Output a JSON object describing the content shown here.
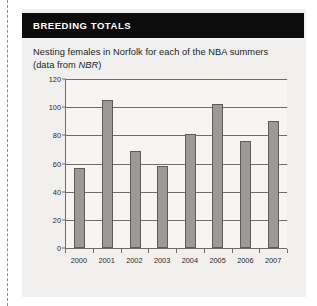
{
  "panel": {
    "header_title": "BREEDING TOTALS",
    "subtitle_line1": "Nesting females in Norfolk for each of the NBA summers",
    "subtitle_line2_pre": "(data from ",
    "subtitle_line2_italic": "NBR",
    "subtitle_line2_post": ")"
  },
  "colors": {
    "header_background": "#0d0d0d",
    "header_text": "#ffffff",
    "panel_background": "#f1f0ef",
    "plot_background": "#f6f5f4",
    "bar_fill": "#9b9a98",
    "bar_border": "#5d5c5a",
    "axis": "#6e6d6b"
  },
  "chart_data": {
    "type": "bar",
    "title": "BREEDING TOTALS",
    "subtitle": "Nesting females in Norfolk for each of the NBA summers (data from NBR)",
    "categories": [
      "2000",
      "2001",
      "2002",
      "2003",
      "2004",
      "2005",
      "2006",
      "2007"
    ],
    "values": [
      57,
      105,
      69,
      58,
      81,
      102,
      76,
      90
    ],
    "xlabel": "",
    "ylabel": "",
    "ylim": [
      0,
      120
    ],
    "yticks": [
      0,
      20,
      40,
      60,
      80,
      100,
      120
    ],
    "ytick_labels": [
      "0",
      "20",
      "40",
      "60",
      "80",
      "100",
      "120"
    ],
    "grid": true,
    "legend": false
  }
}
